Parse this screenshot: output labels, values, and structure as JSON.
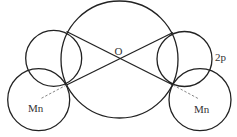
{
  "diagram": {
    "labels": {
      "center": "O",
      "orbital": "2p",
      "left_atom": "Mn",
      "right_atom": "Mn"
    },
    "colors": {
      "line": "#222222",
      "dashed": "#777777",
      "text": "#333333",
      "background": "#ffffff"
    },
    "circles": [
      {
        "name": "central-circle",
        "cx": 119.5,
        "cy": 59.5,
        "r": 59
      },
      {
        "name": "left-upper-circle",
        "cx": 53.7,
        "cy": 58.3,
        "r": 28
      },
      {
        "name": "right-upper-circle",
        "cx": 184.5,
        "cy": 59,
        "r": 27.5
      },
      {
        "name": "left-lower-circle",
        "cx": 38.7,
        "cy": 99.7,
        "r": 31
      },
      {
        "name": "right-lower-circle",
        "cx": 200,
        "cy": 99.7,
        "r": 31
      }
    ]
  }
}
